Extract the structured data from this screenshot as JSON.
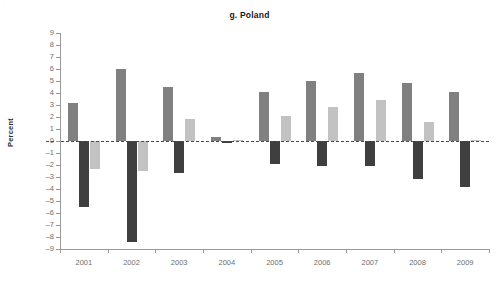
{
  "top_sliver_text": "· · · · · ·",
  "chart_title": "g. Poland",
  "y_axis_title": "Percent",
  "colors": {
    "series1": "#808080",
    "series2": "#3f3f3f",
    "series3": "#c2c2c2",
    "axis": "#9a9a9a",
    "zero_line": "#4a4a4a",
    "tick_text": "#6e6e6e",
    "title_text": "#1a1a1a"
  },
  "chart_data": {
    "type": "bar",
    "title": "g. Poland",
    "xlabel": "",
    "ylabel": "Percent",
    "ylim": [
      -9,
      9
    ],
    "ytick_step": 1,
    "grid": false,
    "legend": "none",
    "zero_line": true,
    "categories": [
      "2001",
      "2002",
      "2003",
      "2004",
      "2005",
      "2006",
      "2007",
      "2008",
      "2009"
    ],
    "ytick_labels": [
      "9",
      "8",
      "7",
      "6",
      "5",
      "4",
      "3",
      "2",
      "1",
      "0",
      "-1",
      "-2",
      "-3",
      "-4",
      "-5",
      "-6",
      "-7",
      "-8",
      "-9"
    ],
    "series": [
      {
        "name": "series-1",
        "color": "#808080",
        "values": [
          3.2,
          6.0,
          4.5,
          0.3,
          4.1,
          5.0,
          5.7,
          4.8,
          4.1
        ]
      },
      {
        "name": "series-2",
        "color": "#3f3f3f",
        "values": [
          -5.5,
          -8.4,
          -2.7,
          -0.15,
          -1.9,
          -2.1,
          -2.1,
          -3.2,
          -3.8
        ]
      },
      {
        "name": "series-3",
        "color": "#c2c2c2",
        "values": [
          -2.3,
          -2.5,
          1.8,
          0.12,
          2.1,
          2.8,
          3.45,
          1.55,
          0.05
        ]
      }
    ]
  }
}
